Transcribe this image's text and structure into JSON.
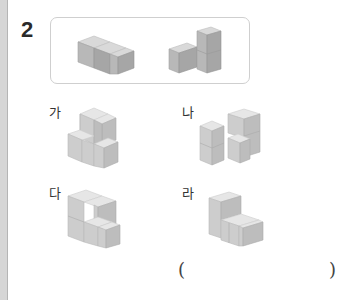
{
  "question": {
    "number": "2"
  },
  "given_pieces": [
    {
      "name": "piece-t-shape",
      "description": "flat T-shaped piece of 4 cubes"
    },
    {
      "name": "piece-l-tower",
      "description": "L-shaped piece with 2-cube tower"
    }
  ],
  "options": [
    {
      "label": "가"
    },
    {
      "label": "나"
    },
    {
      "label": "다"
    },
    {
      "label": "라"
    }
  ],
  "answer": {
    "open_paren": "(",
    "close_paren": ")",
    "value": ""
  },
  "colors": {
    "stripe": "#d6d6d6",
    "box_border": "#cfcfcf",
    "cube_top": "#d9d9d9",
    "cube_left": "#b8b8b8",
    "cube_right": "#a6a6a6"
  }
}
